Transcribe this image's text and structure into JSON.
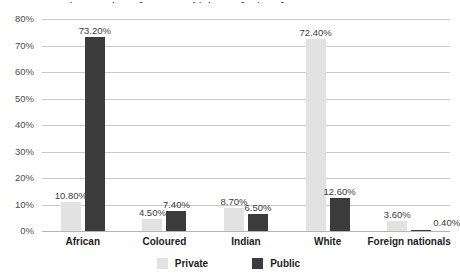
{
  "chart_data": {
    "type": "bar",
    "title": "Workforce profile at top management level by population group and gender",
    "xlabel": "",
    "ylabel": "",
    "ylim": [
      0,
      80
    ],
    "ytick_step": 10,
    "ytick_labels": [
      "80%",
      "70%",
      "60%",
      "50%",
      "40%",
      "30%",
      "20%",
      "10%",
      "0%"
    ],
    "grid": true,
    "legend_position": "bottom-center",
    "categories": [
      "African",
      "Coloured",
      "Indian",
      "White",
      "Foreign nationals"
    ],
    "series": [
      {
        "name": "Private",
        "color": "#e2e2e2",
        "values": [
          10.8,
          4.5,
          8.7,
          72.4,
          3.6
        ],
        "labels": [
          "10.80%",
          "4.50%",
          "8.70%",
          "72.40%",
          "3.60%"
        ]
      },
      {
        "name": "Public",
        "color": "#3b3b3b",
        "values": [
          73.2,
          7.4,
          6.5,
          12.6,
          0.4
        ],
        "labels": [
          "73.20%",
          "7.40%",
          "6.50%",
          "12.60%",
          "0.40%"
        ]
      }
    ]
  },
  "legend": {
    "items": [
      {
        "label": "Private",
        "color": "#e2e2e2"
      },
      {
        "label": "Public",
        "color": "#3b3b3b"
      }
    ]
  },
  "colors": {
    "private": "#e2e2e2",
    "public": "#3b3b3b",
    "gridline": "#c9c9c9",
    "axis": "#b4b4b4",
    "text": "#1d1d1d"
  }
}
